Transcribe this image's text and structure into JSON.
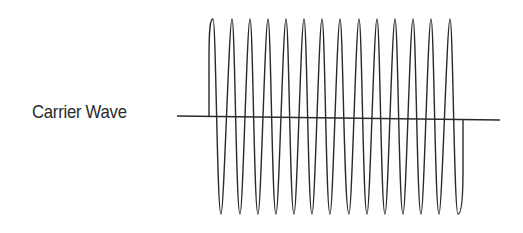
{
  "diagram": {
    "label": "Carrier Wave",
    "ink_color": "#2a2a2a",
    "waveform": {
      "type": "sine",
      "cycles": 14,
      "start_direction": "up",
      "peaks_x": [
        213,
        232,
        250,
        268,
        286,
        304,
        322,
        340,
        359,
        377,
        395,
        413,
        431,
        450
      ],
      "troughs_x": [
        221,
        240,
        258,
        276,
        294,
        312,
        330,
        349,
        367,
        385,
        403,
        421,
        439,
        458
      ]
    }
  }
}
